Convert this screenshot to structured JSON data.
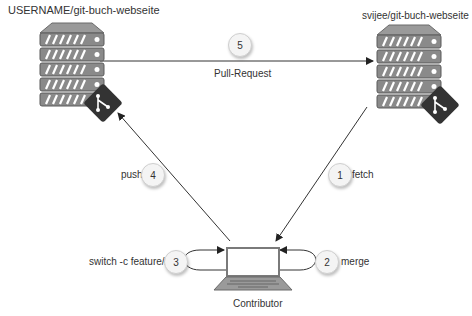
{
  "repos": {
    "origin": {
      "label": "USERNAME/git-buch-webseite",
      "icon": "server-git-icon"
    },
    "upstream": {
      "label": "svijee/git-buch-webseite",
      "icon": "server-git-icon"
    }
  },
  "contributor": {
    "label": "Contributor",
    "icon": "laptop-icon"
  },
  "steps": [
    {
      "number": "1",
      "label": "fetch"
    },
    {
      "number": "2",
      "label": "merge"
    },
    {
      "number": "3",
      "label": "switch -c feature/x"
    },
    {
      "number": "4",
      "label": "push"
    },
    {
      "number": "5",
      "label": "Pull-Request"
    }
  ],
  "colors": {
    "server_fill": "#8a8a8a",
    "server_dark": "#555555",
    "git_badge": "#333333",
    "line": "#333333"
  }
}
